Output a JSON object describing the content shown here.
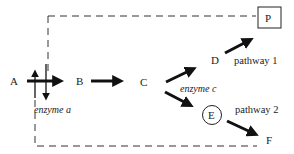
{
  "diagram": {
    "type": "metabolic-pathway",
    "boundary": "dashed-rectangle",
    "nodes": {
      "A": "A",
      "B": "B",
      "C": "C",
      "D": "D",
      "E": "E",
      "F": "F",
      "P": "P"
    },
    "enzymes": {
      "a": "enzyme a",
      "c": "enzyme c"
    },
    "pathways": {
      "one": "pathway 1",
      "two": "pathway 2"
    },
    "edges": [
      {
        "from": "A",
        "to": "B",
        "enzyme": "enzyme a"
      },
      {
        "from": "B",
        "to": "C"
      },
      {
        "from": "C",
        "to": "D",
        "enzyme": "enzyme c"
      },
      {
        "from": "C",
        "to": "E",
        "enzyme": "enzyme c"
      },
      {
        "from": "D",
        "to": "P",
        "label": "pathway 1"
      },
      {
        "from": "E",
        "to": "F",
        "label": "pathway 2"
      }
    ],
    "highlights": {
      "P": "boxed",
      "E": "circled"
    }
  }
}
